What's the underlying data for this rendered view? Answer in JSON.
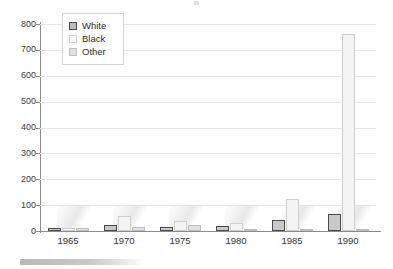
{
  "chart_data": {
    "type": "bar",
    "title": "",
    "xlabel": "",
    "ylabel": "",
    "categories": [
      "1965",
      "1970",
      "1975",
      "1980",
      "1985",
      "1990"
    ],
    "series": [
      {
        "name": "White",
        "values": [
          10,
          22,
          16,
          20,
          42,
          65
        ],
        "color": "#c9c9c9"
      },
      {
        "name": "Black",
        "values": [
          12,
          58,
          37,
          30,
          125,
          760
        ],
        "color": "#f4f4f4"
      },
      {
        "name": "Other",
        "values": [
          13,
          14,
          24,
          5,
          9,
          5
        ],
        "color": "#e2e2e2"
      }
    ],
    "ylim": [
      0,
      800
    ],
    "yticks": [
      0,
      100,
      200,
      300,
      400,
      500,
      600,
      700,
      800
    ],
    "ytick_labels": [
      "0",
      "100",
      "200",
      "300",
      "400",
      "500",
      "600",
      "700",
      "800"
    ],
    "grid": true,
    "legend_position": "upper left",
    "legend_entries": [
      "White",
      "Black",
      "Other"
    ]
  }
}
